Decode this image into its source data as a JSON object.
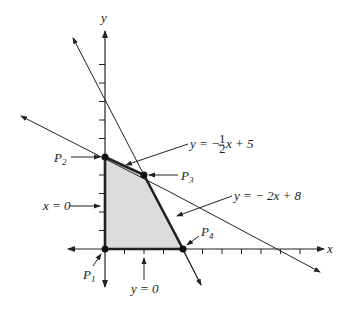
{
  "diagram": {
    "axes": {
      "x_label": "x",
      "y_label": "y"
    },
    "lines": [
      {
        "name": "line-half",
        "equation_prefix": "y = − ",
        "frac_num": "1",
        "frac_den": "2",
        "equation_suffix": "x + 5"
      },
      {
        "name": "line-two",
        "equation": "y = − 2x + 8"
      }
    ],
    "constraints": {
      "x_zero": "x = 0",
      "y_zero": "y = 0"
    },
    "points": [
      {
        "label": "P",
        "sub": "1",
        "coord": [
          0,
          0
        ]
      },
      {
        "label": "P",
        "sub": "2",
        "coord": [
          0,
          5
        ]
      },
      {
        "label": "P",
        "sub": "3",
        "coord": [
          2,
          4
        ]
      },
      {
        "label": "P",
        "sub": "4",
        "coord": [
          4,
          0
        ]
      }
    ],
    "colors": {
      "region_fill": "#dcdcdc",
      "stroke": "#222222"
    }
  }
}
